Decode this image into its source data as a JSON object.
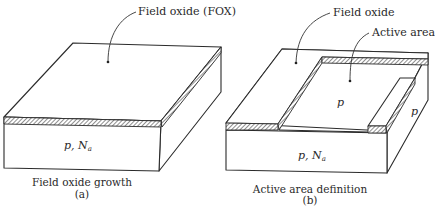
{
  "figure_a": {
    "callout": "Field oxide (FOX)",
    "region_label": "p, N",
    "region_sub": "a",
    "caption": "Field oxide growth",
    "caption_id": "(a)"
  },
  "figure_b": {
    "callout_field_oxide": "Field oxide",
    "callout_active_area": "Active area",
    "active_label": "p",
    "side_label": "p",
    "region_label": "p, N",
    "region_sub": "a",
    "caption": "Active area definition",
    "caption_id": "(b)"
  },
  "colors": {
    "line": "#2b2b2b",
    "background": "#ffffff"
  }
}
